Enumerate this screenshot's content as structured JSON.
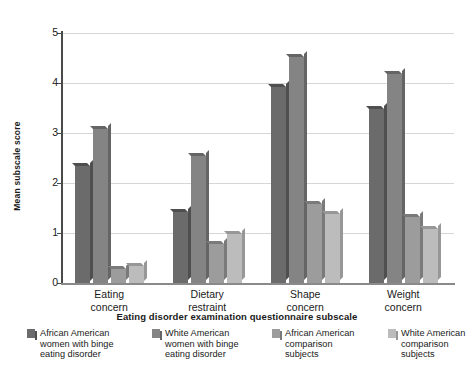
{
  "chart_data": {
    "type": "bar",
    "title": "",
    "xlabel": "Eating disorder examination questionnaire subscale",
    "ylabel": "Mean subscale score",
    "categories": [
      "Eating\nconcern",
      "Dietary\nrestraint",
      "Shape\nconcern",
      "Weight\nconcern"
    ],
    "category_labels": [
      "Eating concern",
      "Dietary restraint",
      "Shape concern",
      "Weight concern"
    ],
    "ylim": [
      0,
      5
    ],
    "yticks": [
      0,
      1,
      2,
      3,
      4,
      5
    ],
    "ytick_labels": [
      "0",
      "1",
      "2",
      "3",
      "4",
      "5"
    ],
    "grid": true,
    "legend_position": "bottom",
    "series": [
      {
        "name": "African American women with binge eating disorder",
        "color": "#6b6b6b",
        "side_color": "#4f4f4f",
        "values": [
          2.35,
          1.42,
          3.92,
          3.48
        ]
      },
      {
        "name": "White American women with binge eating disorder",
        "color": "#848484",
        "side_color": "#656565",
        "values": [
          3.08,
          2.54,
          4.52,
          4.18
        ]
      },
      {
        "name": "African American comparison subjects",
        "color": "#9c9c9c",
        "side_color": "#7a7a7a",
        "values": [
          0.28,
          0.78,
          1.58,
          1.32
        ]
      },
      {
        "name": "White American comparison subjects",
        "color": "#bcbcbc",
        "side_color": "#979797",
        "values": [
          0.35,
          0.98,
          1.38,
          1.08
        ]
      }
    ]
  },
  "axes": {
    "y_title": "Mean subscale score",
    "x_title": "Eating disorder examination questionnaire subscale"
  },
  "legend": {
    "items": [
      {
        "label": "African American\nwomen with binge\neating disorder",
        "color": "#6b6b6b",
        "side_color": "#4f4f4f"
      },
      {
        "label": "White American\nwomen with binge\neating disorder",
        "color": "#848484",
        "side_color": "#656565"
      },
      {
        "label": "African American\ncomparison\nsubjects",
        "color": "#9c9c9c",
        "side_color": "#7a7a7a"
      },
      {
        "label": "White American\ncomparison\nsubjects",
        "color": "#bcbcbc",
        "side_color": "#979797"
      }
    ]
  }
}
